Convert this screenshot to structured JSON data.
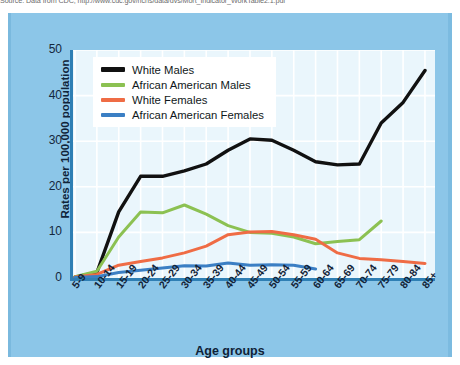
{
  "source_note": "Source: Data from CDC, http://www.cdc.gov/nchs/data/dvs/Mort_Indicator_WorkTable2.1.pdf",
  "colors": {
    "panel_background": "#8cc6e8",
    "plot_background": "#eaf6fc",
    "axis": "#2f7fb4",
    "gridline": "#ffffff",
    "white_males": "#111111",
    "african_american_males": "#8cc152",
    "white_females": "#ef6c45",
    "african_american_females": "#3b7fc4",
    "text": "#12243a"
  },
  "legend": {
    "position": "top-left-inside",
    "entries": [
      {
        "label": "White Males",
        "color": "#111111"
      },
      {
        "label": "African American Males",
        "color": "#8cc152"
      },
      {
        "label": "White Females",
        "color": "#ef6c45"
      },
      {
        "label": "African American Females",
        "color": "#3b7fc4"
      }
    ]
  },
  "chart_data": {
    "type": "line",
    "title": "",
    "xlabel": "Age groups",
    "ylabel": "Rates per 100,000 population",
    "categories": [
      "5-9",
      "10-14",
      "15-19",
      "20-24",
      "25-29",
      "30-34",
      "35-39",
      "40-44",
      "45-49",
      "50-54",
      "55-59",
      "60-64",
      "65-69",
      "70-74",
      "75-79",
      "80-84",
      "85+"
    ],
    "ylim": [
      0,
      50
    ],
    "yticks": [
      0,
      10,
      20,
      30,
      40,
      50
    ],
    "grid": true,
    "series": [
      {
        "name": "White Males",
        "color": "#111111",
        "values": [
          0.2,
          1.2,
          14.5,
          22.3,
          22.3,
          23.5,
          25.0,
          28.0,
          30.5,
          30.2,
          28.0,
          25.5,
          24.8,
          25.0,
          34.0,
          38.5,
          45.5
        ]
      },
      {
        "name": "African American Males",
        "color": "#8cc152",
        "values": [
          0.3,
          1.5,
          9.0,
          14.5,
          14.3,
          16.0,
          14.0,
          11.5,
          10.0,
          9.8,
          9.0,
          7.5,
          8.0,
          8.4,
          12.5,
          null,
          null
        ]
      },
      {
        "name": "White Females",
        "color": "#ef6c45",
        "values": [
          0.2,
          0.8,
          2.8,
          3.6,
          4.4,
          5.5,
          7.0,
          9.5,
          10.1,
          10.2,
          9.5,
          8.5,
          5.5,
          4.3,
          4.0,
          3.6,
          3.2
        ]
      },
      {
        "name": "African American Females",
        "color": "#3b7fc4",
        "values": [
          0.1,
          0.3,
          1.2,
          1.7,
          2.2,
          2.7,
          2.6,
          3.3,
          2.8,
          2.9,
          2.8,
          2.0,
          null,
          null,
          null,
          null,
          null
        ]
      }
    ]
  }
}
